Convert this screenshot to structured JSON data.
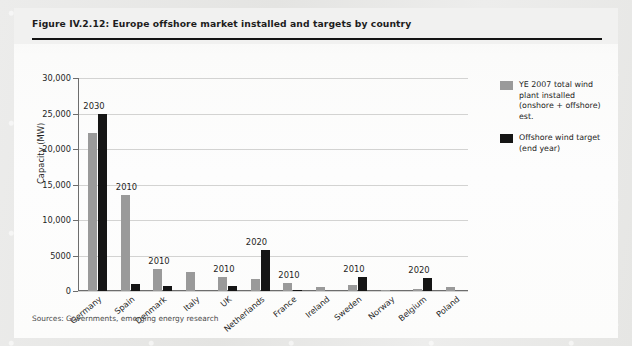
{
  "figure": {
    "title": "Figure IV.2.12: Europe offshore market installed and targets by country",
    "source_note": "Sources: Governments, emerging energy research"
  },
  "legend": {
    "position": "top-right",
    "items": [
      {
        "label": "YE 2007 total wind plant installed (onshore + offshore) est.",
        "color": "#9a9a9a",
        "key": "installed"
      },
      {
        "label": "Offshore wind target (end year)",
        "color": "#151515",
        "key": "target"
      }
    ]
  },
  "chart_data": {
    "type": "bar",
    "title": "Europe offshore market installed and targets by country",
    "xlabel": "",
    "ylabel": "Capacity (MW)",
    "ylim": [
      0,
      30000
    ],
    "yticks": [
      0,
      5000,
      10000,
      15000,
      20000,
      25000,
      30000
    ],
    "ytick_labels": [
      "0",
      "5000",
      "10,000",
      "15,000",
      "20,000",
      "25,000",
      "30,000"
    ],
    "grid": true,
    "categories": [
      "Germany",
      "Spain",
      "Denmark",
      "Italy",
      "UK",
      "Netherlands",
      "France",
      "Ireland",
      "Sweden",
      "Norway",
      "Belgium",
      "Poland"
    ],
    "series": [
      {
        "name": "YE 2007 total wind plant installed (onshore + offshore) est.",
        "color": "#9a9a9a",
        "values": [
          22200,
          13500,
          3100,
          2700,
          2000,
          1700,
          1100,
          600,
          800,
          200,
          300,
          500
        ]
      },
      {
        "name": "Offshore wind target (end year)",
        "color": "#151515",
        "values": [
          25000,
          1000,
          700,
          0,
          700,
          5800,
          200,
          0,
          2000,
          0,
          1900,
          0
        ]
      }
    ],
    "annotations": [
      {
        "category": "Germany",
        "text": "2030"
      },
      {
        "category": "Spain",
        "text": "2010"
      },
      {
        "category": "Denmark",
        "text": "2010"
      },
      {
        "category": "UK",
        "text": "2010"
      },
      {
        "category": "Netherlands",
        "text": "2020"
      },
      {
        "category": "France",
        "text": "2010"
      },
      {
        "category": "Sweden",
        "text": "2010"
      },
      {
        "category": "Belgium",
        "text": "2020"
      }
    ]
  }
}
